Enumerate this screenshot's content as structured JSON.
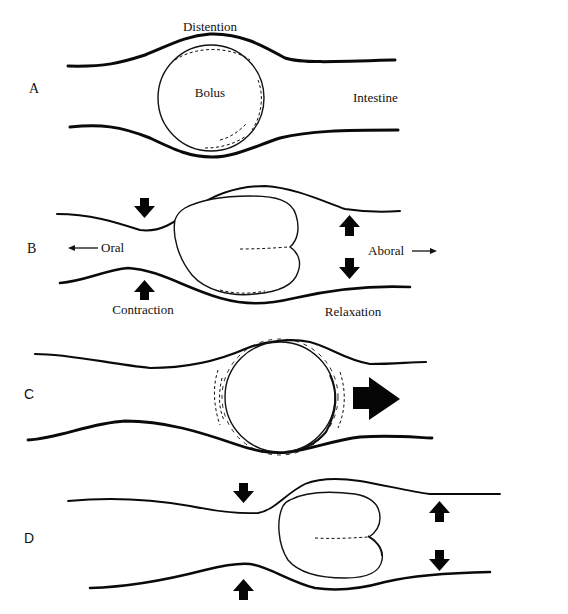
{
  "figure": {
    "panels": [
      {
        "id": "A",
        "letter": "A",
        "labels": {
          "distention": "Distention",
          "bolus": "Bolus",
          "intestine": "Intestine"
        }
      },
      {
        "id": "B",
        "letter": "B",
        "labels": {
          "oral": "Oral",
          "aboral": "Aboral",
          "contraction": "Contraction",
          "relaxation": "Relaxation"
        },
        "icons": [
          "contraction-arrow-down",
          "contraction-arrow-up",
          "relaxation-arrow-up",
          "relaxation-arrow-down",
          "oral-direction-arrow",
          "aboral-direction-arrow"
        ]
      },
      {
        "id": "C",
        "letter": "C",
        "icons": [
          "propulsion-arrow-right"
        ]
      },
      {
        "id": "D",
        "letter": "D",
        "icons": [
          "contraction-arrow-down",
          "contraction-arrow-up",
          "relaxation-arrow-up",
          "relaxation-arrow-down"
        ]
      }
    ],
    "caption": {
      "visible_text": ""
    },
    "colors": {
      "ink": "#0a0a0a",
      "background": "#ffffff",
      "caption_grey": "#9a9a9a"
    }
  }
}
